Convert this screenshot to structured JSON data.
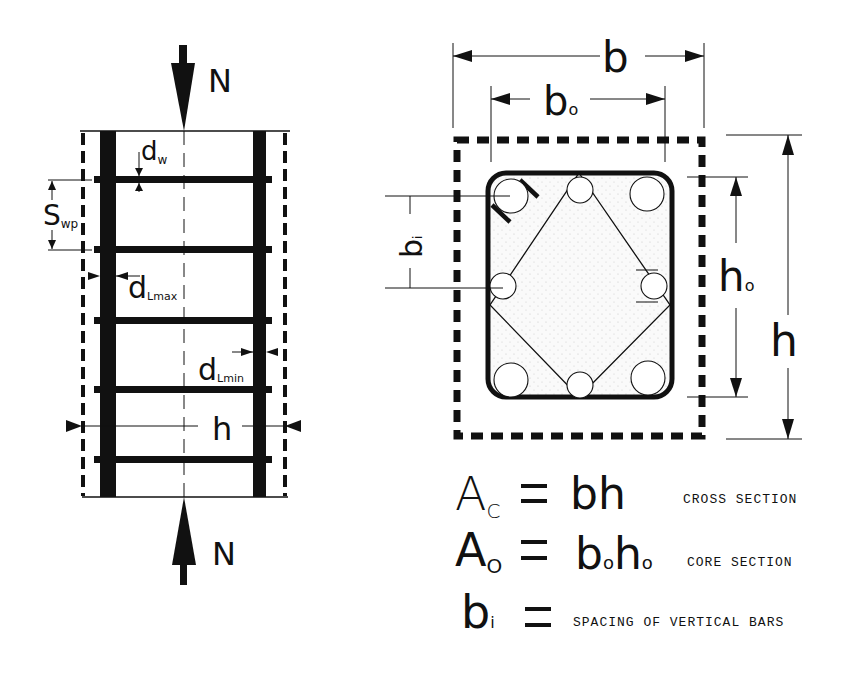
{
  "elevation": {
    "load_label_top": "N",
    "load_label_bottom": "N",
    "stirrup_diameter": {
      "main": "d",
      "sub": "w"
    },
    "stirrup_spacing": {
      "main": "S",
      "sub": "wp"
    },
    "long_bar_max": {
      "main": "d",
      "sub": "Lmax"
    },
    "long_bar_min": {
      "main": "d",
      "sub": "Lmin"
    },
    "height_label": "h"
  },
  "cross_section": {
    "width_label": "b",
    "core_width": {
      "main": "b",
      "sub": "o"
    },
    "core_height": {
      "main": "h",
      "sub": "o"
    },
    "height_label": "h",
    "bar_spacing": {
      "main": "b",
      "sub": "i"
    }
  },
  "formulas": [
    {
      "lhs_main": "A",
      "lhs_sub": "C",
      "eq": "=",
      "rhs": "bh",
      "rhs_parts": [],
      "desc": "CROSS SECTION"
    },
    {
      "lhs_main": "A",
      "lhs_sub": "O",
      "eq": "=",
      "rhs": "",
      "rhs_parts": [
        {
          "main": "b",
          "sub": "o"
        },
        {
          "main": "h",
          "sub": "o"
        }
      ],
      "desc": "CORE SECTION"
    },
    {
      "lhs_main": "b",
      "lhs_sub": "i",
      "eq": "=",
      "rhs": "",
      "rhs_parts": [],
      "desc": "SPACING OF VERTICAL BARS"
    }
  ],
  "colors": {
    "ink": "#111111",
    "background": "#ffffff",
    "core_fill": "#f4f4f4"
  }
}
